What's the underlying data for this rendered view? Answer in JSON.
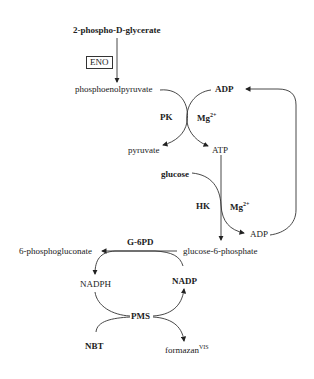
{
  "diagram": {
    "title": "",
    "nodes": {
      "pg2": "2-phospho-D-glycerate",
      "eno": "ENO",
      "pep": "phosphoenolpyruvate",
      "adp_top": "ADP",
      "pk": "PK",
      "mg1": "Mg",
      "mg1_sup": "2+",
      "pyruvate": "pyruvate",
      "atp": "ATP",
      "glucose": "glucose",
      "hk": "HK",
      "mg2": "Mg",
      "mg2_sup": "2+",
      "adp_bottom": "ADP",
      "g6pd": "G-6PD",
      "pgluconate": "6-phosphogluconate",
      "g6p": "glucose-6-phosphate",
      "nadph": "NADPH",
      "nadp": "NADP",
      "pms": "PMS",
      "nbt": "NBT",
      "formazan": "formazan",
      "formazan_sup": "VIS"
    },
    "edges": [
      {
        "from": "2-phospho-D-glycerate",
        "to": "phosphoenolpyruvate",
        "enzyme": "ENO"
      },
      {
        "from": "phosphoenolpyruvate",
        "to": "pyruvate",
        "enzyme": "PK"
      },
      {
        "from": "ADP",
        "to": "ATP",
        "enzyme": "PK",
        "cofactor": "Mg2+"
      },
      {
        "from": "ATP",
        "to": "glucose-6-phosphate",
        "enzyme": "HK"
      },
      {
        "from": "glucose",
        "to": "ADP",
        "enzyme": "HK",
        "cofactor": "Mg2+"
      },
      {
        "from": "ADP",
        "to": "ADP (top)",
        "type": "recycle"
      },
      {
        "from": "glucose-6-phosphate",
        "to": "6-phosphogluconate",
        "enzyme": "G-6PD"
      },
      {
        "from": "NADP",
        "to": "NADPH",
        "enzyme": "G-6PD"
      },
      {
        "from": "NADPH",
        "to": "NADP",
        "via": "PMS"
      },
      {
        "from": "NBT",
        "to": "formazan VIS",
        "via": "PMS"
      }
    ]
  }
}
